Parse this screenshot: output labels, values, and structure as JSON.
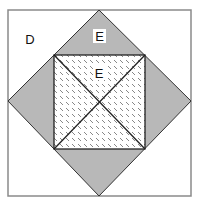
{
  "diagram": {
    "outer_square": {
      "x": 8,
      "y": 10,
      "width": 183,
      "height": 186,
      "stroke": "#8a8a8a"
    },
    "diamond": {
      "points": [
        [
          99,
          10
        ],
        [
          191,
          101
        ],
        [
          99,
          196
        ],
        [
          8,
          101
        ]
      ],
      "fill": "#b8b8b8",
      "stroke": "#333333"
    },
    "inner_square": {
      "x": 54,
      "y": 55,
      "width": 91,
      "height": 94,
      "pattern": "dashed-diagonal-hatch",
      "stroke": "#222222"
    },
    "diagonals": true,
    "labels": {
      "corner_region": "D",
      "top_triangle": "E",
      "inner_triangle": "E"
    },
    "colors": {
      "background": "#ffffff",
      "gray_fill": "#b8b8b8",
      "line": "#222222"
    }
  }
}
